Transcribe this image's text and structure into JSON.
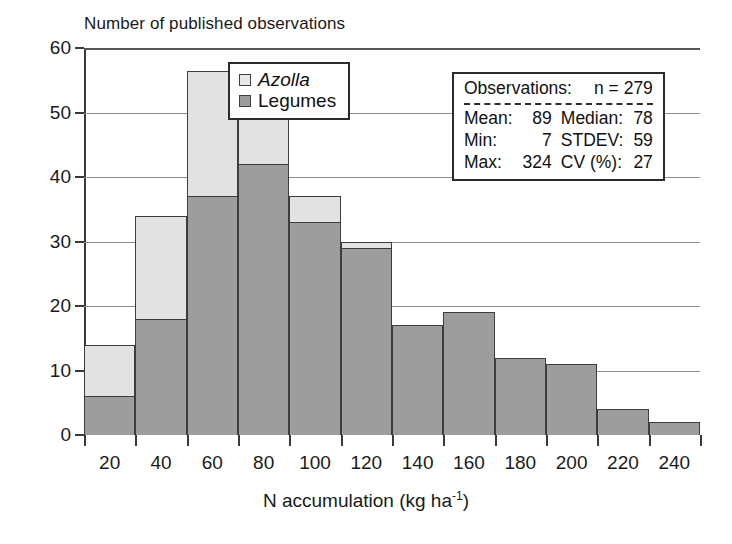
{
  "chart_data": {
    "type": "bar",
    "title": "Number of published observations",
    "xlabel": "N accumulation (kg ha",
    "xlabel_sup": "-1",
    "xlabel_close": ")",
    "ylabel": "Number of published observations",
    "categories": [
      "20",
      "40",
      "60",
      "80",
      "100",
      "120",
      "140",
      "160",
      "180",
      "200",
      "220",
      "240"
    ],
    "ylim": [
      0,
      60
    ],
    "yticks": [
      0,
      10,
      20,
      30,
      40,
      50,
      60
    ],
    "grid": true,
    "stacked": true,
    "legend_position": "top-center",
    "series": [
      {
        "name": "Legumes",
        "color": "#9d9d9d",
        "values": [
          6,
          18,
          37,
          42,
          33,
          29,
          17,
          19,
          12,
          11,
          4,
          2
        ]
      },
      {
        "name": "Azolla",
        "color": "#e2e2e2",
        "values": [
          8,
          16,
          19.5,
          8,
          4,
          1,
          0,
          0,
          0,
          0,
          0,
          0
        ]
      }
    ],
    "totals": [
      14,
      34,
      56.5,
      50,
      37,
      30,
      17,
      19,
      12,
      11,
      4,
      2
    ]
  },
  "legend": {
    "items": [
      {
        "label": "Azolla",
        "italic": true,
        "color": "#e8e8e8"
      },
      {
        "label": "Legumes",
        "italic": false,
        "color": "#9d9d9d"
      }
    ]
  },
  "stats": {
    "head_label": "Observations:",
    "head_value": "n = 279",
    "rows": [
      {
        "k1": "Mean:",
        "v1": "89",
        "k2": "Median:",
        "v2": "78"
      },
      {
        "k1": "Min:",
        "v1": "7",
        "k2": "STDEV:",
        "v2": "59"
      },
      {
        "k1": "Max:",
        "v1": "324",
        "k2": "CV (%):",
        "v2": "27"
      }
    ]
  }
}
